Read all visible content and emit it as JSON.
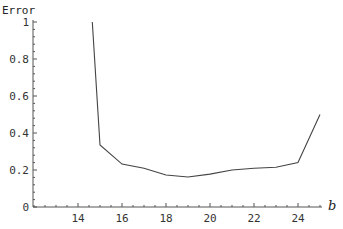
{
  "chart_data": {
    "type": "line",
    "title": "",
    "xlabel": "b",
    "ylabel": "Error",
    "xlim": [
      12,
      25
    ],
    "ylim": [
      0,
      1
    ],
    "x_ticks": [
      14,
      16,
      18,
      20,
      22,
      24
    ],
    "y_ticks": [
      0,
      0.2,
      0.4,
      0.6,
      0.8,
      1
    ],
    "y_tick_labels": [
      "0",
      "0.2",
      "0.4",
      "0.6",
      "0.8",
      "1"
    ],
    "grid": false,
    "legend": null,
    "series": [
      {
        "name": "Error",
        "x": [
          14.65,
          15,
          16,
          17,
          18,
          19,
          20,
          21,
          22,
          23,
          24,
          25
        ],
        "y": [
          1.0,
          0.335,
          0.232,
          0.21,
          0.173,
          0.162,
          0.178,
          0.2,
          0.21,
          0.215,
          0.24,
          0.5
        ]
      }
    ]
  },
  "style": {
    "line_color": "#444444",
    "axis_color": "#555555"
  }
}
